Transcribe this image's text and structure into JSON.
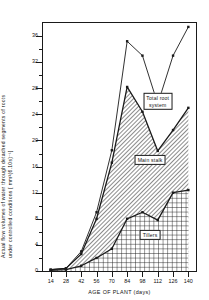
{
  "chart_data": {
    "type": "area",
    "title": "",
    "xlabel": "AGE  OF  PLANT (days)",
    "ylabel_line1": "Actual flow volumes of water through detached segments of roots",
    "ylabel_line2": "under controlled conditions [ mm³(6.10s)⁻¹]",
    "x": [
      14,
      28,
      42,
      56,
      70,
      84,
      98,
      112,
      126,
      140
    ],
    "xlim": [
      7,
      147
    ],
    "ylim": [
      0,
      38
    ],
    "yticks": [
      0,
      4,
      8,
      12,
      16,
      20,
      24,
      28,
      32,
      36
    ],
    "ytick_labels": [
      "0",
      "4",
      "8",
      "12",
      "16",
      "20",
      "24",
      "28",
      "32",
      "36"
    ],
    "xtick_labels": [
      "14",
      "28",
      "42",
      "56",
      "70",
      "84",
      "98",
      "112",
      "126",
      "140"
    ],
    "grid": false,
    "legend_position": "inside-annotations",
    "series": [
      {
        "name": "Total root system",
        "fill": "none",
        "values": [
          0.2,
          0.4,
          3.0,
          9.0,
          18.5,
          35.2,
          33.0,
          25.6,
          33.0,
          37.4
        ]
      },
      {
        "name": "Main stalk",
        "fill": "diagonal-hatch",
        "values": [
          0.2,
          0.4,
          2.6,
          8.0,
          16.6,
          28.2,
          24.4,
          18.4,
          21.6,
          25.0
        ]
      },
      {
        "name": "Tillers",
        "fill": "cross-hatch",
        "values": [
          0.1,
          0.2,
          0.8,
          2.0,
          3.4,
          8.0,
          9.0,
          7.8,
          12.0,
          12.4
        ]
      }
    ],
    "annotations": [
      {
        "text": "Total root system",
        "x": 112,
        "y": 26
      },
      {
        "text": "Main stalk",
        "x": 105,
        "y": 17
      },
      {
        "text": "Tillers",
        "x": 105,
        "y": 5.5
      }
    ],
    "colors": {
      "line": "#1a1a1a",
      "axis": "#1a1a1a",
      "background": "#ffffff"
    }
  },
  "annotation_labels": {
    "total_root_system_l1": "Total root",
    "total_root_system_l2": "system",
    "main_stalk": "Main stalk",
    "tillers": "Tillers"
  }
}
